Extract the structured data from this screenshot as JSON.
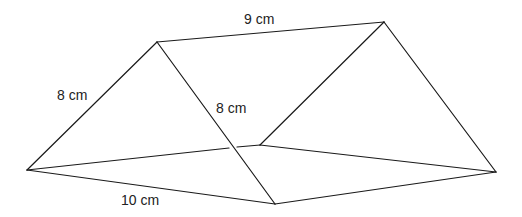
{
  "figure": {
    "type": "triangular-prism",
    "stroke_color": "#1a1a1a",
    "vertices": {
      "front_apex": [
        157,
        42
      ],
      "back_apex": [
        384,
        22
      ],
      "front_left": [
        27,
        170
      ],
      "front_right": [
        275,
        204
      ],
      "back_left": [
        260,
        145
      ],
      "back_right": [
        496,
        172
      ]
    },
    "edges": [
      {
        "id": "ridge",
        "from": "front_apex",
        "to": "back_apex"
      },
      {
        "id": "front-left-slant",
        "from": "front_left",
        "to": "front_apex"
      },
      {
        "id": "front-right-slant",
        "from": "front_apex",
        "to": "front_right"
      },
      {
        "id": "back-left-slant",
        "from": "back_left",
        "to": "back_apex"
      },
      {
        "id": "back-right-slant",
        "from": "back_apex",
        "to": "back_right"
      },
      {
        "id": "front-base",
        "from": "front_left",
        "to": "front_right"
      },
      {
        "id": "right-base",
        "from": "front_right",
        "to": "back_right"
      },
      {
        "id": "back-base",
        "from": "back_left",
        "to": "back_right"
      },
      {
        "id": "left-base",
        "from": "front_left",
        "to": "back_left"
      }
    ]
  },
  "labels": {
    "ridge_length": "9 cm",
    "left_slant_length": "8 cm",
    "right_slant_length": "8 cm",
    "base_length": "10 cm"
  }
}
